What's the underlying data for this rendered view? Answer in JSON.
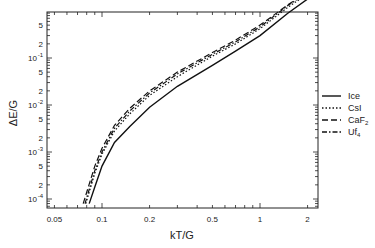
{
  "chart_data": {
    "type": "line",
    "title": "",
    "xlabel": "kT/G",
    "ylabel": "ΔE/G",
    "xscale": "log",
    "yscale": "log",
    "xlim": [
      0.042,
      2.4
    ],
    "ylim": [
      7e-05,
      9
    ],
    "grid": false,
    "legend_position": "right, outside plot",
    "x_ticks": [
      {
        "value": 0.05,
        "label": "0.05"
      },
      {
        "value": 0.1,
        "label": "0.1"
      },
      {
        "value": 0.2,
        "label": "0.2"
      },
      {
        "value": 0.5,
        "label": "0.5"
      },
      {
        "value": 1,
        "label": "1"
      },
      {
        "value": 2,
        "label": "2"
      }
    ],
    "y_ticks": [
      {
        "value": 0.0001,
        "label": "10",
        "exp": "-4"
      },
      {
        "value": 0.0002,
        "label": "2",
        "exp": ""
      },
      {
        "value": 0.0005,
        "label": "5",
        "exp": ""
      },
      {
        "value": 0.001,
        "label": "10",
        "exp": "-3"
      },
      {
        "value": 0.002,
        "label": "2",
        "exp": ""
      },
      {
        "value": 0.005,
        "label": "5",
        "exp": ""
      },
      {
        "value": 0.01,
        "label": "10",
        "exp": "-2"
      },
      {
        "value": 0.02,
        "label": "2",
        "exp": ""
      },
      {
        "value": 0.05,
        "label": "5",
        "exp": ""
      },
      {
        "value": 0.1,
        "label": "10",
        "exp": "-1"
      },
      {
        "value": 0.2,
        "label": "2",
        "exp": ""
      },
      {
        "value": 0.5,
        "label": "5",
        "exp": ""
      },
      {
        "value": 2,
        "label": "2",
        "exp": ""
      },
      {
        "value": 5,
        "label": "5",
        "exp": ""
      }
    ],
    "series": [
      {
        "name": "Ice",
        "style": "solid",
        "x": [
          0.083,
          0.09,
          0.1,
          0.12,
          0.15,
          0.2,
          0.3,
          0.5,
          0.7,
          1.0,
          1.5,
          2.0
        ],
        "y": [
          8e-05,
          0.00018,
          0.0005,
          0.0016,
          0.0035,
          0.009,
          0.025,
          0.07,
          0.14,
          0.3,
          0.9,
          1.8
        ]
      },
      {
        "name": "CsI",
        "style": "dotted",
        "x": [
          0.079,
          0.09,
          0.1,
          0.12,
          0.15,
          0.2,
          0.3,
          0.5,
          0.7,
          1.0,
          1.5,
          2.0
        ],
        "y": [
          8e-05,
          0.00035,
          0.0009,
          0.0028,
          0.0065,
          0.016,
          0.04,
          0.11,
          0.2,
          0.42,
          1.2,
          2.3
        ]
      },
      {
        "name": "CaF₂",
        "style": "dashed",
        "x": [
          0.076,
          0.09,
          0.1,
          0.12,
          0.15,
          0.2,
          0.3,
          0.5,
          0.7,
          1.0,
          1.5,
          2.0
        ],
        "y": [
          8e-05,
          0.0005,
          0.0012,
          0.0037,
          0.0085,
          0.02,
          0.05,
          0.13,
          0.24,
          0.5,
          1.35,
          2.6
        ]
      },
      {
        "name": "UF₄",
        "style": "dash-dot",
        "x": [
          0.078,
          0.09,
          0.1,
          0.12,
          0.15,
          0.2,
          0.3,
          0.5,
          0.7,
          1.0,
          1.5,
          2.0
        ],
        "y": [
          8e-05,
          0.0004,
          0.001,
          0.0032,
          0.0075,
          0.018,
          0.046,
          0.12,
          0.22,
          0.46,
          1.3,
          2.5
        ]
      }
    ]
  },
  "legend": [
    {
      "label": "Ice",
      "sub": "",
      "dash": ""
    },
    {
      "label": "CsI",
      "sub": "",
      "dash": "1.5,2"
    },
    {
      "label": "CaF",
      "sub": "2",
      "dash": "6,3"
    },
    {
      "label": "Uf",
      "sub": "4",
      "dash": "5,2,1.5,2"
    }
  ],
  "axis_labels": {
    "x": "kT/G",
    "y": "ΔE/G"
  }
}
